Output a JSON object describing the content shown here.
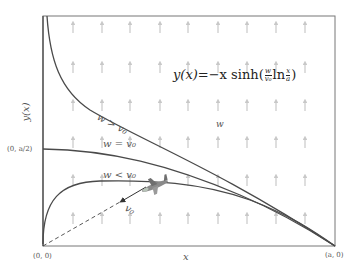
{
  "figure": {
    "equation": {
      "lhs": "y(x)",
      "rhs_prefix": "=−x sinh(",
      "frac1_num": "w",
      "frac1_den": "v₀",
      "ln": "ln",
      "frac2_num": "x",
      "frac2_den": "a",
      "close": ")"
    },
    "axes": {
      "ylabel": "y(x)",
      "xlabel": "x",
      "origin_label": "(0, 0)",
      "y_mid_label": "(0, a/2)",
      "x_end_label": "(a, 0)"
    },
    "curves": [
      {
        "label": "w > v₀",
        "meaning": "wind faster than plane"
      },
      {
        "label": "w = v₀",
        "meaning": "wind equals plane speed"
      },
      {
        "label": "w < v₀",
        "meaning": "wind slower than plane"
      }
    ],
    "wind_label": "w",
    "velocity_label": "v₀",
    "colors": {
      "frame": "#666666",
      "curve": "#4a4a4a",
      "wind_arrow": "#c8c8c8",
      "text": "#555555"
    }
  }
}
